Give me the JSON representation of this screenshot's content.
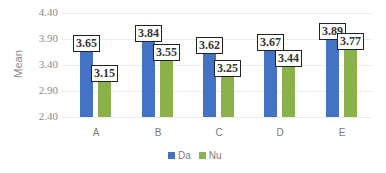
{
  "chart_data": {
    "type": "bar",
    "title": "",
    "xlabel": "",
    "ylabel": "Mean",
    "ylim": [
      2.4,
      4.4
    ],
    "yticks": [
      "4.40",
      "3.90",
      "3.40",
      "2.90",
      "2.40"
    ],
    "categories": [
      "A",
      "B",
      "C",
      "D",
      "E"
    ],
    "series": [
      {
        "name": "Da",
        "color": "#4472c4",
        "values": [
          3.65,
          3.84,
          3.62,
          3.67,
          3.89
        ]
      },
      {
        "name": "Nu",
        "color": "#8bb24a",
        "values": [
          3.15,
          3.55,
          3.25,
          3.44,
          3.77
        ]
      }
    ],
    "grid": true,
    "legend_position": "bottom"
  }
}
